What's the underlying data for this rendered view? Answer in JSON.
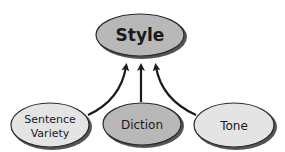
{
  "diagram": {
    "root": {
      "label": "Style",
      "fill": "#b8b8b8"
    },
    "children": [
      {
        "label_line1": "Sentence",
        "label_line2": "Variety",
        "fill": "#e4e4e4"
      },
      {
        "label": "Diction",
        "fill": "#b8b8b8"
      },
      {
        "label": "Tone",
        "fill": "#e4e4e4"
      }
    ],
    "edge_color": "#1a1a1a"
  }
}
